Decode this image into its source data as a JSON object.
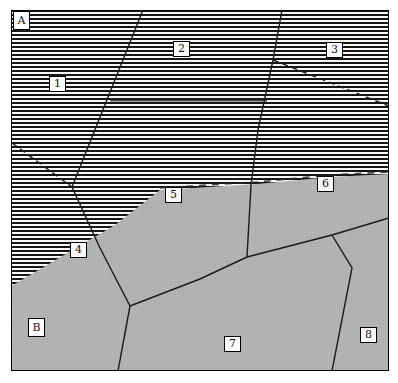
{
  "colors": {
    "stripe_dark": "#161616",
    "stripe_light": "#f7f7f7",
    "matrix_gray": "#b5b5b5",
    "line_color": "#1a1a1a",
    "frame_color": "#000000",
    "paper_white": "#ffffff"
  },
  "labels": {
    "a": "A",
    "b": "B",
    "n1": "1",
    "n2": "2",
    "n3": "3",
    "n4": "4",
    "n5": "5",
    "n6": "6",
    "n7": "7",
    "n8": "8"
  },
  "regions": {
    "a_texture": "horizontal-lamellae",
    "b_texture": "gray-matrix"
  }
}
